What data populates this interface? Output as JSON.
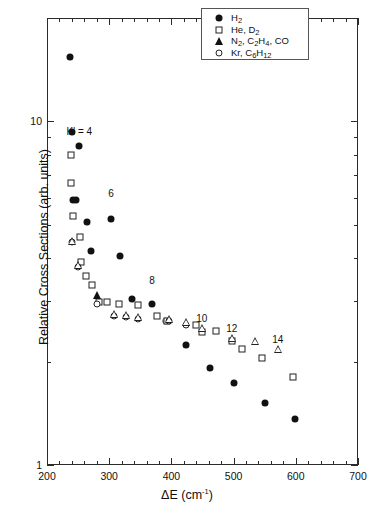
{
  "chart_data": {
    "type": "scatter",
    "title": "",
    "xlabel": "ΔE (cm-1)",
    "ylabel": "Relative Cross Sections (arb. units)",
    "xlim": [
      200,
      700
    ],
    "ylim": [
      1,
      20
    ],
    "yscale": "log",
    "xticks": [
      200,
      300,
      400,
      500,
      600,
      700
    ],
    "xtick_labels": [
      "200",
      "300",
      "400",
      "500",
      "600",
      "700"
    ],
    "yticks": [
      1,
      10
    ],
    "ytick_labels": [
      "1",
      "10"
    ],
    "grid": false,
    "legend_position": "top-right",
    "legend": [
      {
        "label": "H2",
        "marker": "filled-circle"
      },
      {
        "label": "He, D2",
        "marker": "open-square"
      },
      {
        "label": "N2, C2H4, CO",
        "marker": "filled-triangle"
      },
      {
        "label": "Kr, C6H12",
        "marker": "open-circle"
      }
    ],
    "annotations": [
      {
        "text": "K' = 4",
        "x": 252,
        "y": 9.4
      },
      {
        "text": "6",
        "x": 303,
        "y": 6.2
      },
      {
        "text": "8",
        "x": 369,
        "y": 3.45
      },
      {
        "text": "10",
        "x": 449,
        "y": 2.68
      },
      {
        "text": "12",
        "x": 497,
        "y": 2.5
      },
      {
        "text": "14",
        "x": 571,
        "y": 2.32
      }
    ],
    "series": [
      {
        "name": "H2",
        "marker": "filled-circle",
        "points": [
          [
            237,
            15.4
          ],
          [
            240,
            9.3
          ],
          [
            252,
            8.5
          ],
          [
            241,
            5.9
          ],
          [
            247,
            5.9
          ],
          [
            264,
            5.1
          ],
          [
            271,
            4.2
          ],
          [
            303,
            5.2
          ],
          [
            318,
            4.05
          ],
          [
            369,
            2.95
          ],
          [
            337,
            3.05
          ],
          [
            392,
            2.62
          ],
          [
            424,
            2.23
          ],
          [
            462,
            1.92
          ],
          [
            501,
            1.73
          ],
          [
            551,
            1.52
          ],
          [
            599,
            1.36
          ]
        ]
      },
      {
        "name": "He, D2",
        "marker": "open-square",
        "points": [
          [
            239,
            8.0
          ],
          [
            239,
            6.6
          ],
          [
            241,
            5.3
          ],
          [
            253,
            4.6
          ],
          [
            255,
            3.9
          ],
          [
            262,
            3.55
          ],
          [
            272,
            3.35
          ],
          [
            283,
            2.98
          ],
          [
            296,
            2.98
          ],
          [
            315,
            2.95
          ],
          [
            346,
            2.92
          ],
          [
            377,
            2.72
          ],
          [
            393,
            2.63
          ],
          [
            440,
            2.55
          ],
          [
            449,
            2.44
          ],
          [
            471,
            2.45
          ],
          [
            497,
            2.3
          ],
          [
            513,
            2.18
          ],
          [
            546,
            2.05
          ],
          [
            596,
            1.8
          ]
        ]
      },
      {
        "name": "N2, C2H4, CO",
        "marker": "filled-triangle",
        "points": [
          [
            280,
            3.12
          ]
        ]
      },
      {
        "name": "Kr, C6H12",
        "marker": "open-circle",
        "points": [
          [
            240,
            4.45
          ],
          [
            250,
            3.78
          ],
          [
            281,
            2.95
          ],
          [
            308,
            2.72
          ],
          [
            327,
            2.7
          ],
          [
            347,
            2.66
          ],
          [
            396,
            2.62
          ],
          [
            424,
            2.56
          ]
        ]
      },
      {
        "name": "Kr-open-triangle-overlay",
        "marker": "open-triangle",
        "points": [
          [
            240,
            4.5
          ],
          [
            250,
            3.82
          ],
          [
            308,
            2.76
          ],
          [
            327,
            2.74
          ],
          [
            347,
            2.7
          ],
          [
            396,
            2.66
          ],
          [
            424,
            2.6
          ],
          [
            449,
            2.5
          ],
          [
            497,
            2.35
          ],
          [
            535,
            2.3
          ],
          [
            571,
            2.18
          ]
        ]
      }
    ]
  }
}
